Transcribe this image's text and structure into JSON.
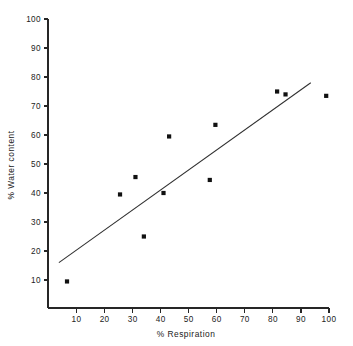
{
  "chart_data": {
    "type": "scatter",
    "title": "",
    "xlabel": "% Respiration",
    "ylabel": "% Water content",
    "xlim": [
      0,
      103
    ],
    "ylim": [
      0,
      103
    ],
    "grid": false,
    "legend": null,
    "xticks": [
      10,
      20,
      30,
      40,
      50,
      60,
      70,
      80,
      90,
      100
    ],
    "yticks": [
      10,
      20,
      30,
      40,
      50,
      60,
      70,
      80,
      90,
      100
    ],
    "xtick_labels": [
      "10",
      "20",
      "30",
      "40",
      "50",
      "60",
      "70",
      "80",
      "90",
      "100"
    ],
    "ytick_labels": [
      "10",
      "20",
      "30",
      "40",
      "50",
      "60",
      "70",
      "80",
      "90",
      "100"
    ],
    "points": [
      {
        "x": 6.6,
        "y": 9.5
      },
      {
        "x": 25.5,
        "y": 39.5
      },
      {
        "x": 31.0,
        "y": 45.5
      },
      {
        "x": 34.0,
        "y": 25.0
      },
      {
        "x": 41.0,
        "y": 40.0
      },
      {
        "x": 43.0,
        "y": 59.5
      },
      {
        "x": 57.5,
        "y": 44.5
      },
      {
        "x": 59.5,
        "y": 63.5
      },
      {
        "x": 81.5,
        "y": 75.0
      },
      {
        "x": 84.5,
        "y": 74.0
      },
      {
        "x": 99.0,
        "y": 73.5
      }
    ],
    "trend_line": {
      "x0": 3.7,
      "y0": 16.0,
      "x1": 93.5,
      "y1": 78.0
    },
    "marker_size_px": 2.1,
    "colors": {
      "axis": "#262626",
      "point": "#111111",
      "line": "#303030",
      "background": "#ffffff"
    }
  }
}
